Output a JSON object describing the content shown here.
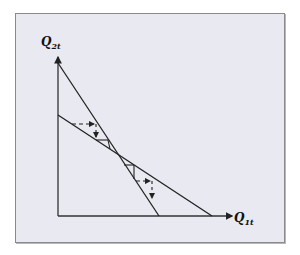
{
  "diagram": {
    "type": "cobweb-model",
    "y_axis": {
      "label": "Q",
      "subscript": "2t"
    },
    "x_axis": {
      "label": "Q",
      "subscript": "1t"
    },
    "lines": [
      {
        "name": "steep-reaction-line",
        "from": [
          58,
          63
        ],
        "to": [
          159,
          216
        ]
      },
      {
        "name": "shallow-reaction-line",
        "from": [
          58,
          115
        ],
        "to": [
          212,
          216
        ]
      }
    ],
    "colors": {
      "background": "#e9e9f1",
      "line": "#222222",
      "frame": "#8a8a8a"
    }
  }
}
